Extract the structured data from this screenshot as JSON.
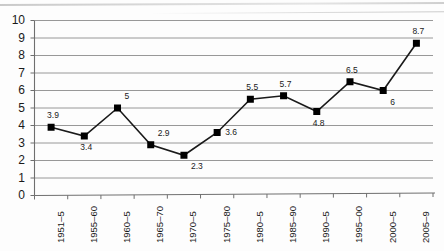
{
  "chart_data": {
    "type": "line",
    "title": "",
    "subtitle": "",
    "xlabel": "",
    "ylabel": "",
    "ylim": [
      0,
      10
    ],
    "yticks": [
      0,
      1,
      2,
      3,
      4,
      5,
      6,
      7,
      8,
      9,
      10
    ],
    "ytick_labels": [
      "0",
      "1",
      "2",
      "3",
      "4",
      "5",
      "6",
      "7",
      "8",
      "9",
      "10"
    ],
    "grid": true,
    "grid_axis": "y",
    "legend": false,
    "legend_position": "none",
    "marker": "square",
    "marker_color": "#000000",
    "line_color": "#1a1a1a",
    "categories": [
      "1951–5",
      "1955–60",
      "1960–5",
      "1965–70",
      "1970–5",
      "1975–80",
      "1980–5",
      "1985–90",
      "1990–5",
      "1995–00",
      "2000–5",
      "2005–9"
    ],
    "values": [
      3.9,
      3.4,
      5,
      2.9,
      2.3,
      3.6,
      5.5,
      5.7,
      4.8,
      6.5,
      6,
      8.7
    ],
    "data_labels": [
      "3.9",
      "3.4",
      "5",
      "2.9",
      "2.3",
      "3.6",
      "5.5",
      "5.7",
      "4.8",
      "6.5",
      "6",
      "8.7"
    ],
    "data_label_positions": [
      "above",
      "below",
      "above-right",
      "above-right",
      "below-right",
      "right",
      "above",
      "above",
      "below",
      "above",
      "below-right",
      "above"
    ]
  },
  "colors": {
    "gridline": "#8c8c8c",
    "axis": "#6f6f6f",
    "series": "#000000",
    "background": "#fdfdfd"
  }
}
